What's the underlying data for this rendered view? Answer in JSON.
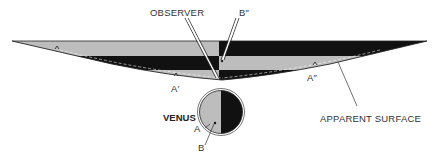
{
  "diagram": {
    "labels": {
      "observer": "OBSERVER",
      "b_double_prime": "B″",
      "a_prime": "A′",
      "a_double_prime": "A″",
      "apparent_surface": "APPARENT SURFACE",
      "venus": "VENUS",
      "a": "A",
      "b": "B"
    },
    "colors": {
      "light_band": "#bdbdbd",
      "dark_band": "#111111",
      "outline": "#222222",
      "label_text": "#333333",
      "background": "#ffffff"
    }
  }
}
